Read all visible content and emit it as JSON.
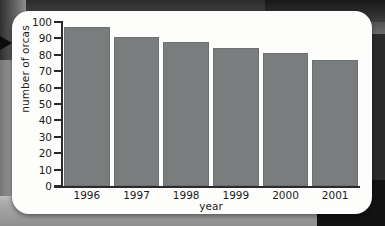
{
  "figure": {
    "card_label": "bar-chart-card",
    "background_note": "scanned textbook page"
  },
  "chart_data": {
    "type": "bar",
    "title": "",
    "categories": [
      "1996",
      "1997",
      "1998",
      "1999",
      "2000",
      "2001"
    ],
    "values": [
      97,
      91,
      88,
      84,
      81,
      77
    ],
    "xlabel": "year",
    "ylabel": "number of orcas",
    "ylim": [
      0,
      100
    ],
    "ytick_labels": [
      "100",
      "90",
      "80",
      "70",
      "60",
      "50",
      "40",
      "30",
      "20",
      "10",
      "0"
    ],
    "ytick_values": [
      100,
      90,
      80,
      70,
      60,
      50,
      40,
      30,
      20,
      10,
      0
    ],
    "grid": false,
    "legend": null,
    "bar_color": "#7a7d7d",
    "axis_color": "#2a2a2a",
    "plot_background": "#fdfdfb"
  },
  "decor": {
    "pointer_icon": "right-arrow-icon"
  }
}
